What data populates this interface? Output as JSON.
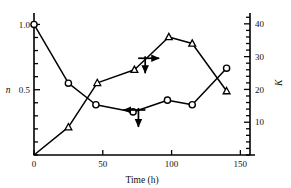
{
  "chart_data": {
    "type": "line",
    "title": "",
    "xlabel": "Time (h)",
    "ylabel": "n",
    "y2label": "K",
    "xlim": [
      0,
      157
    ],
    "ylim": [
      0,
      1.08
    ],
    "y2lim": [
      0,
      43
    ],
    "xticks": [
      0,
      50,
      100,
      150
    ],
    "xticklabels": [
      "0",
      "50",
      "100",
      "150"
    ],
    "yticks": [
      0.5,
      1.0
    ],
    "yticklabels": [
      "0.5",
      "1.0"
    ],
    "y2ticks": [
      10,
      20,
      30,
      40
    ],
    "y2ticklabels": [
      "10",
      "20",
      "30",
      "40"
    ],
    "grid": false,
    "legend": "none",
    "series": [
      {
        "name": "n",
        "axis": "left",
        "marker": "circle",
        "x": [
          0,
          25,
          45,
          72,
          97,
          115,
          140
        ],
        "values": [
          1.0,
          0.55,
          0.385,
          0.33,
          0.42,
          0.385,
          0.665
        ]
      },
      {
        "name": "K",
        "axis": "right",
        "marker": "triangle",
        "x": [
          0,
          25,
          46,
          73,
          98,
          115,
          140
        ],
        "values": [
          0.0,
          8.5,
          22.0,
          26.0,
          36.0,
          34.0,
          19.5
        ]
      }
    ],
    "annotations": [
      {
        "name": "k-axis-pointer",
        "text": "",
        "direction": "right-and-down",
        "at_x": 83,
        "at_y": 29.5
      },
      {
        "name": "n-axis-pointer",
        "text": "",
        "direction": "left-and-down",
        "at_x": 73,
        "at_y": 0.345
      }
    ]
  },
  "style": {
    "line_color": "#000000",
    "marker_fill": "#ffffff",
    "axis_color": "#000000",
    "background": "#ffffff"
  }
}
